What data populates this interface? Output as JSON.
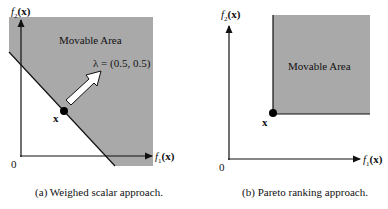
{
  "colors": {
    "region_fill": "#a9a9a9",
    "line": "#111111",
    "background": "#ffffff"
  },
  "panels": [
    {
      "id": "a",
      "region_label": "Movable Area",
      "point_label": "x",
      "vector_label": "λ = (0.5, 0.5)",
      "y_axis_label": {
        "f": "f",
        "sub": "2",
        "arg": "(x)"
      },
      "x_axis_label": {
        "f": "f",
        "sub": "1",
        "arg": "(x)"
      },
      "origin_label": "0",
      "caption": "(a) Weighed scalar approach."
    },
    {
      "id": "b",
      "region_label": "Movable Area",
      "point_label": "x",
      "y_axis_label": {
        "f": "f",
        "sub": "2",
        "arg": "(x)"
      },
      "x_axis_label": {
        "f": "f",
        "sub": "1",
        "arg": "(x)"
      },
      "origin_label": "0",
      "caption": "(b) Pareto ranking approach."
    }
  ]
}
